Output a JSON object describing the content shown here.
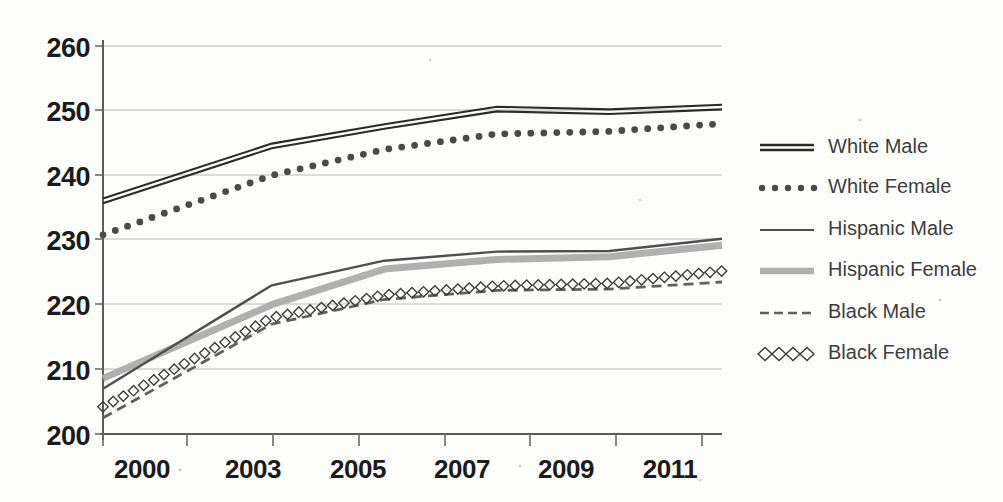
{
  "chart_data": {
    "type": "line",
    "title": "",
    "xlabel": "",
    "ylabel": "",
    "x": [
      2000,
      2003,
      2005,
      2007,
      2009,
      2011
    ],
    "categories": [
      "2000",
      "2003",
      "2005",
      "2007",
      "2009",
      "2011"
    ],
    "xtick_labels": [
      "2000",
      "2003",
      "2005",
      "2007",
      "2009",
      "2011"
    ],
    "ytick_labels": [
      "200",
      "210",
      "220",
      "230",
      "240",
      "250",
      "260"
    ],
    "yticks": [
      200,
      210,
      220,
      230,
      240,
      250,
      260
    ],
    "ylim": [
      200,
      260
    ],
    "xlim": [
      2000,
      2011
    ],
    "grid": true,
    "legend_position": "right",
    "series": [
      {
        "name": "White Male",
        "style": "double-solid",
        "color": "#2b2b2b",
        "values": [
          236.0,
          244.5,
          247.5,
          250.2,
          249.8,
          250.5
        ]
      },
      {
        "name": "White Female",
        "style": "dotted",
        "color": "#4a4a4a",
        "values": [
          230.8,
          240.0,
          244.0,
          246.4,
          246.8,
          248.0
        ]
      },
      {
        "name": "Hispanic Male",
        "style": "solid",
        "color": "#4f4f4f",
        "values": [
          207.0,
          223.0,
          226.8,
          228.2,
          228.3,
          230.2
        ]
      },
      {
        "name": "Hispanic Female",
        "style": "thick-solid",
        "color": "#b0b0b0",
        "values": [
          208.6,
          220.0,
          225.5,
          227.0,
          227.4,
          229.2
        ]
      },
      {
        "name": "Black Male",
        "style": "dashed",
        "color": "#606060",
        "values": [
          202.5,
          217.0,
          220.8,
          222.2,
          222.4,
          223.5
        ]
      },
      {
        "name": "Black Female",
        "style": "diamond-marker",
        "color": "#3a3a3a",
        "values": [
          204.2,
          218.0,
          221.5,
          222.9,
          223.3,
          225.2
        ]
      }
    ]
  },
  "legend": {
    "items": [
      {
        "label": "White Male",
        "swatch": "double-solid-swatch"
      },
      {
        "label": "White Female",
        "swatch": "dotted-swatch"
      },
      {
        "label": "Hispanic Male",
        "swatch": "solid-swatch"
      },
      {
        "label": "Hispanic Female",
        "swatch": "thick-gray-swatch"
      },
      {
        "label": "Black Male",
        "swatch": "dashed-swatch"
      },
      {
        "label": "Black Female",
        "swatch": "diamond-swatch"
      }
    ]
  }
}
